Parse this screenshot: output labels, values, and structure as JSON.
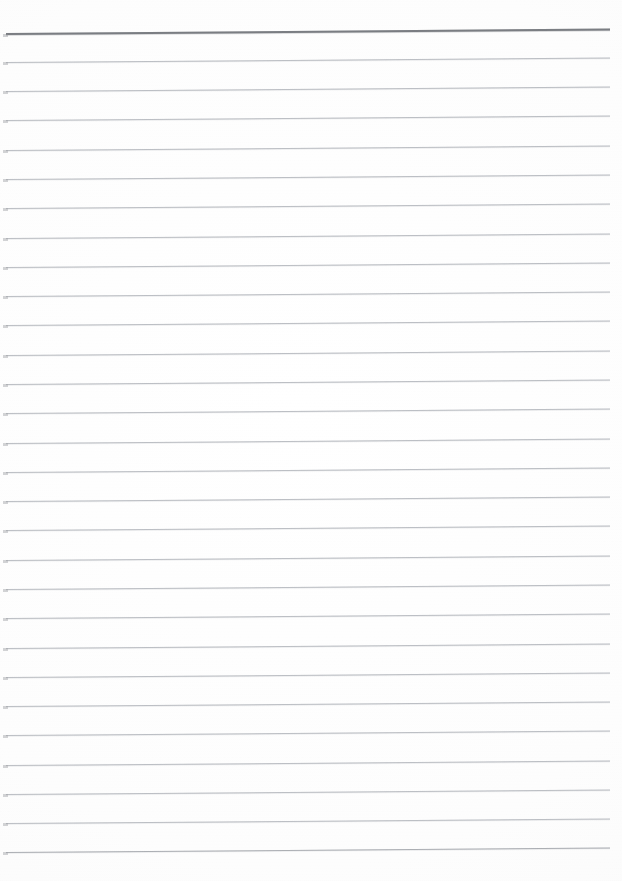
{
  "document": {
    "kind": "scanned-lined-paper",
    "title": "Blank Ruled Paper Scan",
    "description": "A scanned sheet of blank lined writing paper with no handwriting or printed text.",
    "page_width": 622,
    "page_height": 881,
    "visible_text": "",
    "text_content_count": 0
  },
  "appearance": {
    "paper_color": "#fdfdfd",
    "page_edge_color": "#f8f8f8",
    "rule_color": "#bcbfc4",
    "header_rule_color": "#7c7f84",
    "strong_rule_color": "#a5a8ad"
  },
  "ruling": {
    "line_count": 29,
    "spacing_px": 29.5,
    "left_margin_px": 6,
    "right_margin_px": 12,
    "line_start_x": 6,
    "line_end_x": 610,
    "first_line_y": 33,
    "last_line_y": 852,
    "skew_degrees": -0.42,
    "skew_note": "lines rise slightly toward the right edge",
    "lines": [
      {
        "index": 1,
        "y": 33,
        "weight": "header",
        "color": "#7c7f84"
      },
      {
        "index": 2,
        "y": 62,
        "weight": "normal",
        "color": "#bcbfc4"
      },
      {
        "index": 3,
        "y": 91,
        "weight": "normal",
        "color": "#bcbfc4"
      },
      {
        "index": 4,
        "y": 120,
        "weight": "normal",
        "color": "#bcbfc4"
      },
      {
        "index": 5,
        "y": 150,
        "weight": "normal",
        "color": "#bcbfc4"
      },
      {
        "index": 6,
        "y": 179,
        "weight": "normal",
        "color": "#bcbfc4"
      },
      {
        "index": 7,
        "y": 208,
        "weight": "normal",
        "color": "#bcbfc4"
      },
      {
        "index": 8,
        "y": 238,
        "weight": "normal",
        "color": "#bcbfc4"
      },
      {
        "index": 9,
        "y": 267,
        "weight": "normal",
        "color": "#bcbfc4"
      },
      {
        "index": 10,
        "y": 296,
        "weight": "normal",
        "color": "#bcbfc4"
      },
      {
        "index": 11,
        "y": 325,
        "weight": "normal",
        "color": "#bcbfc4"
      },
      {
        "index": 12,
        "y": 355,
        "weight": "normal",
        "color": "#bcbfc4"
      },
      {
        "index": 13,
        "y": 384,
        "weight": "normal",
        "color": "#bcbfc4"
      },
      {
        "index": 14,
        "y": 413,
        "weight": "normal",
        "color": "#bcbfc4"
      },
      {
        "index": 15,
        "y": 443,
        "weight": "normal",
        "color": "#bcbfc4"
      },
      {
        "index": 16,
        "y": 472,
        "weight": "normal",
        "color": "#bcbfc4"
      },
      {
        "index": 17,
        "y": 501,
        "weight": "normal",
        "color": "#bcbfc4"
      },
      {
        "index": 18,
        "y": 530,
        "weight": "normal",
        "color": "#bcbfc4"
      },
      {
        "index": 19,
        "y": 560,
        "weight": "normal",
        "color": "#bcbfc4"
      },
      {
        "index": 20,
        "y": 589,
        "weight": "normal",
        "color": "#bcbfc4"
      },
      {
        "index": 21,
        "y": 618,
        "weight": "normal",
        "color": "#bcbfc4"
      },
      {
        "index": 22,
        "y": 648,
        "weight": "normal",
        "color": "#bcbfc4"
      },
      {
        "index": 23,
        "y": 677,
        "weight": "normal",
        "color": "#bcbfc4"
      },
      {
        "index": 24,
        "y": 706,
        "weight": "normal",
        "color": "#bcbfc4"
      },
      {
        "index": 25,
        "y": 735,
        "weight": "normal",
        "color": "#bcbfc4"
      },
      {
        "index": 26,
        "y": 765,
        "weight": "normal",
        "color": "#bcbfc4"
      },
      {
        "index": 27,
        "y": 794,
        "weight": "normal",
        "color": "#bcbfc4"
      },
      {
        "index": 28,
        "y": 823,
        "weight": "normal",
        "color": "#bcbfc4"
      },
      {
        "index": 29,
        "y": 852,
        "weight": "strong",
        "color": "#a5a8ad"
      }
    ]
  }
}
